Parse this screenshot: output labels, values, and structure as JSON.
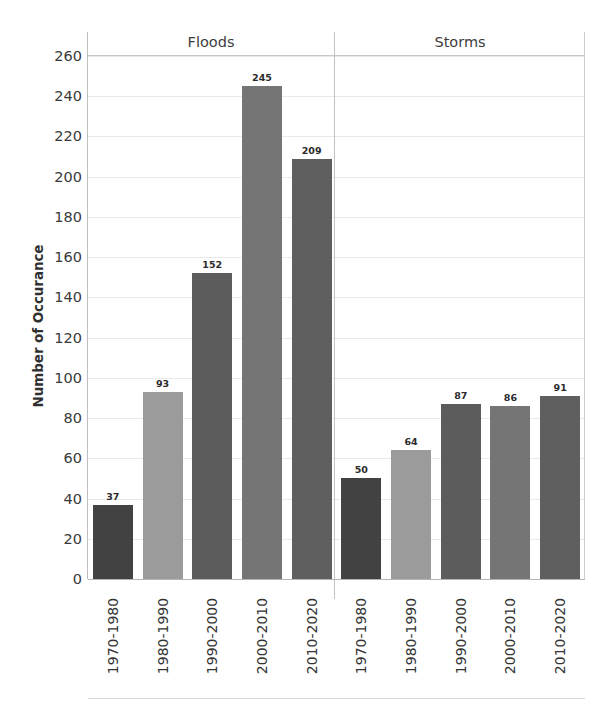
{
  "chart_data": {
    "type": "bar",
    "title": "",
    "xlabel": "",
    "ylabel": "Number of Occurance",
    "ylim": [
      0,
      260
    ],
    "ytick_step": 20,
    "yticks": [
      260,
      240,
      220,
      200,
      180,
      160,
      140,
      120,
      100,
      80,
      60,
      40,
      20,
      0
    ],
    "grid": true,
    "legend": "none",
    "group_labels": [
      "Floods",
      "Storms"
    ],
    "categories": [
      "1970-1980",
      "1980-1990",
      "1990-2000",
      "2000-2010",
      "2010-2020"
    ],
    "groups": [
      {
        "name": "Floods",
        "categories": [
          "1970-1980",
          "1980-1990",
          "1990-2000",
          "2000-2010",
          "2010-2020"
        ],
        "values": [
          37,
          93,
          152,
          245,
          209
        ]
      },
      {
        "name": "Storms",
        "categories": [
          "1970-1980",
          "1980-1990",
          "1990-2000",
          "2000-2010",
          "2010-2020"
        ],
        "values": [
          50,
          64,
          87,
          86,
          91
        ]
      }
    ],
    "bar_colors": [
      "#424242",
      "#9b9b9b",
      "#5c5c5c",
      "#757575",
      "#5f5f5f"
    ],
    "axis_color": "#bfbfbf",
    "gridline_color": "#e9e9e9",
    "label_color": "#2b2b2b"
  }
}
